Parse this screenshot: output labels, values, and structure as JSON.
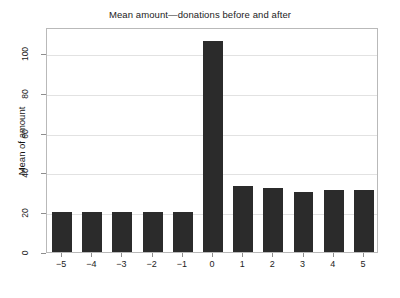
{
  "chart_data": {
    "type": "bar",
    "title": "Mean amount—donations before and after",
    "xlabel": "",
    "ylabel": "Mean of amount",
    "categories": [
      "-5",
      "-4",
      "-3",
      "-2",
      "-1",
      "0",
      "1",
      "2",
      "3",
      "4",
      "5"
    ],
    "tick_labels_x": [
      "−5",
      "−4",
      "−3",
      "−2",
      "−1",
      "0",
      "1",
      "2",
      "3",
      "4",
      "5"
    ],
    "values": [
      20,
      20,
      20,
      20,
      20,
      106,
      33,
      32,
      30,
      31,
      31
    ],
    "ylim": [
      0,
      113
    ],
    "yticks": [
      0,
      20,
      40,
      60,
      80,
      100
    ],
    "ytick_labels": [
      "0",
      "20",
      "40",
      "60",
      "80",
      "100"
    ],
    "grid": "horizontal",
    "legend": "none",
    "bar_color": "#2b2b2b",
    "gridline_color": "#e2e2e2",
    "frame_color": "#b9b9b9",
    "background": "#ffffff"
  },
  "figure": {
    "bottom_note": ""
  }
}
